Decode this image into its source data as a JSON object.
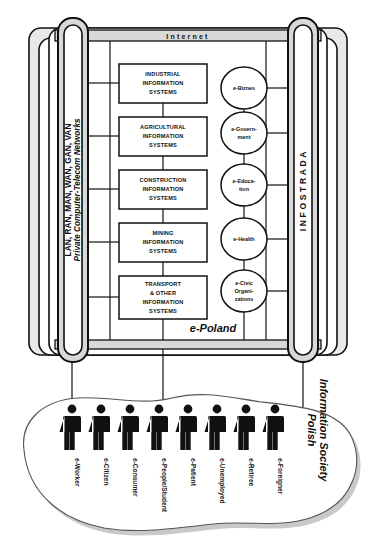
{
  "diagram": {
    "title": "e-Poland",
    "internet_bar": {
      "label": "Internet"
    },
    "left_pillar": {
      "line1": "LAN, RAN, MAN, WAN, GAN, VAN",
      "line2": "Private Computer-Telecom Networks"
    },
    "right_pillar": {
      "label": "INFOSTRADA"
    },
    "information_systems": [
      {
        "id": "industrial",
        "lines": [
          "INDUSTRIAL",
          "INFORMATION",
          "SYSTEMS"
        ]
      },
      {
        "id": "agricultural",
        "lines": [
          "AGRICULTURAL",
          "INFORMATION",
          "SYSTEMS"
        ]
      },
      {
        "id": "construction",
        "lines": [
          "CONSTRUCTION",
          "INFORMATION",
          "SYSTEMS"
        ]
      },
      {
        "id": "mining",
        "lines": [
          "MINING",
          "INFORMATION",
          "SYSTEMS"
        ]
      },
      {
        "id": "transport",
        "lines": [
          "TRANSPORT",
          "& OTHER",
          "INFORMATION",
          "SYSTEMS"
        ]
      }
    ],
    "e_services": [
      {
        "id": "e-biznes",
        "lines": [
          "e-Biznes"
        ]
      },
      {
        "id": "e-government",
        "lines": [
          "e-Govern-",
          "ment"
        ]
      },
      {
        "id": "e-education",
        "lines": [
          "e-Educa-",
          "tion"
        ]
      },
      {
        "id": "e-health",
        "lines": [
          "e-Health"
        ]
      },
      {
        "id": "e-civic-organizations",
        "lines": [
          "e-Civic",
          "Organi-",
          "zations"
        ]
      }
    ],
    "society": {
      "label_line1": "Polish",
      "label_line2": "Information Society",
      "people": [
        {
          "id": "e-worker",
          "label": "e-Worker"
        },
        {
          "id": "e-citizen",
          "label": "e-Citizen"
        },
        {
          "id": "e-consumer",
          "label": "e-Consumer"
        },
        {
          "id": "e-people-student",
          "label": "e-People/Student"
        },
        {
          "id": "e-patient",
          "label": "e-Patient"
        },
        {
          "id": "e-unemployed",
          "label": "e-Unemployed"
        },
        {
          "id": "e-retiree",
          "label": "e-Retiree"
        },
        {
          "id": "e-foreigner",
          "label": "e-Foreigner"
        }
      ]
    },
    "colors": {
      "ink": "#111111",
      "frame_fill": "#e9e9e9",
      "pillar_fill": "#d8d8d8",
      "page": "#ffffff"
    }
  }
}
